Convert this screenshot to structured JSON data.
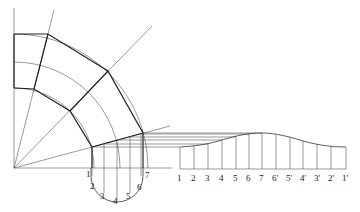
{
  "diagram": {
    "type": "pipe elbow projection with development",
    "half_circle_labels": [
      "1",
      "2",
      "3",
      "4",
      "5",
      "6",
      "7"
    ],
    "development_labels": [
      "1",
      "2",
      "3",
      "4",
      "5",
      "6",
      "7",
      "6'",
      "5'",
      "4'",
      "3'",
      "2'",
      "1'"
    ]
  }
}
